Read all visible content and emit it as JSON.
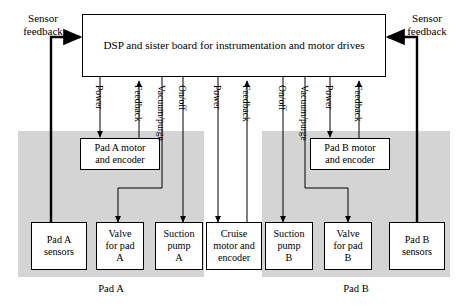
{
  "diagram": {
    "title_block": {
      "id": "dsp-board",
      "label": "DSP and sister board for instrumentation and motor drives"
    },
    "corner_labels": [
      {
        "id": "sensor-feedback-left",
        "label": "Sensor\nfeedback"
      },
      {
        "id": "sensor-feedback-right",
        "label": "Sensor\nfeedback"
      }
    ],
    "zones": [
      {
        "id": "pad-a-zone",
        "caption": "Pad A",
        "color": "#d4d4d4"
      },
      {
        "id": "pad-b-zone",
        "caption": "Pad B",
        "color": "#d4d4d4"
      }
    ],
    "nodes": [
      {
        "id": "pad-a-motor",
        "label": "Pad A motor\nand encoder"
      },
      {
        "id": "pad-b-motor",
        "label": "Pad B motor\nand encoder"
      },
      {
        "id": "pad-a-sensors",
        "label": "Pad A\nsensors"
      },
      {
        "id": "valve-pad-a",
        "label": "Valve\nfor pad\nA"
      },
      {
        "id": "suction-pump-a",
        "label": "Suction\npump\nA"
      },
      {
        "id": "cruise-motor",
        "label": "Cruise\nmotor and\nencoder"
      },
      {
        "id": "suction-pump-b",
        "label": "Suction\npump\nB"
      },
      {
        "id": "valve-pad-b",
        "label": "Valve\nfor pad\nB"
      },
      {
        "id": "pad-b-sensors",
        "label": "Pad B\nsensors"
      }
    ],
    "edge_labels": [
      {
        "id": "edge-power-a-motor",
        "label": "Power"
      },
      {
        "id": "edge-feedback-a-motor",
        "label": "Feedback"
      },
      {
        "id": "edge-vacuum-purge-a",
        "label": "Vacuum/purge"
      },
      {
        "id": "edge-onoff-a",
        "label": "On/off"
      },
      {
        "id": "edge-power-cruise",
        "label": "Power"
      },
      {
        "id": "edge-feedback-cruise",
        "label": "Feedback"
      },
      {
        "id": "edge-onoff-b",
        "label": "On/off"
      },
      {
        "id": "edge-vacuum-purge-b",
        "label": "Vacuum/purge"
      },
      {
        "id": "edge-power-b-motor",
        "label": "Power"
      },
      {
        "id": "edge-feedback-b-motor",
        "label": "Feedback"
      }
    ],
    "colors": {
      "zone_fill": "#d4d4d4",
      "line": "#000000",
      "box_fill": "#ffffff",
      "page_bg": "#ffffff"
    }
  }
}
